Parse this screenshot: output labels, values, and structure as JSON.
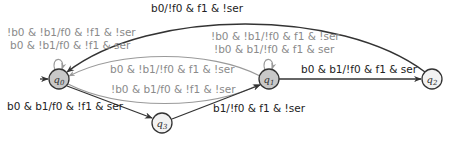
{
  "diagram": {
    "type": "state-machine",
    "colors": {
      "dark_edge": "#333333",
      "gray_edge": "#9a9a9a",
      "state_fill_active": "#c8c8c8",
      "state_fill": "#f2f2f2",
      "label_dark": "#222222",
      "label_gray": "#8a8a8a"
    },
    "states": [
      {
        "id": "q0",
        "name": "q",
        "sub": "0",
        "initial": true,
        "shaded": true
      },
      {
        "id": "q1",
        "name": "q",
        "sub": "1",
        "initial": false,
        "shaded": true
      },
      {
        "id": "q2",
        "name": "q",
        "sub": "2",
        "initial": false,
        "shaded": false
      },
      {
        "id": "q3",
        "name": "q",
        "sub": "3",
        "initial": false,
        "shaded": false
      }
    ],
    "transitions": [
      {
        "from": "q0",
        "to": "q0",
        "style": "gray",
        "labels": [
          "!b0 & !b1/f0 & !f1 & !ser",
          "b0 & !b1/f0 & !f1 & ser"
        ]
      },
      {
        "from": "q1",
        "to": "q1",
        "style": "gray",
        "labels": [
          "!b0 & !b1/!f0 & f1 & !ser",
          "!b0 & b1/!f0 & f1 & ser"
        ]
      },
      {
        "from": "q2",
        "to": "q0",
        "style": "dark",
        "labels": [
          "b0/!f0 & f1 & !ser"
        ]
      },
      {
        "from": "q1",
        "to": "q0",
        "style": "gray",
        "labels": [
          "b0 & !b1/!f0 & f1 & !ser"
        ]
      },
      {
        "from": "q0",
        "to": "q1",
        "style": "gray",
        "labels": [
          "!b0 & b1/f0 & !f1 & !ser"
        ]
      },
      {
        "from": "q1",
        "to": "q2",
        "style": "dark",
        "labels": [
          "b0 & b1/!f0 & f1 & ser"
        ]
      },
      {
        "from": "q0",
        "to": "q3",
        "style": "dark",
        "labels": [
          "b0 & b1/f0 & !f1 & ser"
        ]
      },
      {
        "from": "q3",
        "to": "q1",
        "style": "dark",
        "labels": [
          "b1/!f0 & f1 & !ser"
        ]
      }
    ]
  }
}
